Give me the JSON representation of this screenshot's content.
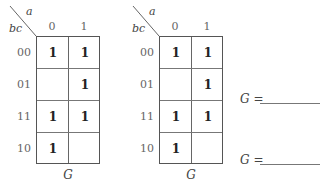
{
  "kmaps": [
    {
      "var_top": "a",
      "var_left": "bc",
      "col_headers": [
        "0",
        "1"
      ],
      "row_headers": [
        "00",
        "01",
        "11",
        "10"
      ],
      "cells": [
        [
          "1",
          "1"
        ],
        [
          "",
          "1"
        ],
        [
          "1",
          "1"
        ],
        [
          "1",
          ""
        ]
      ],
      "name": "G"
    },
    {
      "var_top": "a",
      "var_left": "bc",
      "col_headers": [
        "0",
        "1"
      ],
      "row_headers": [
        "00",
        "01",
        "11",
        "10"
      ],
      "cells": [
        [
          "1",
          "1"
        ],
        [
          "",
          "1"
        ],
        [
          "1",
          "1"
        ],
        [
          "1",
          ""
        ]
      ],
      "name": "G"
    }
  ],
  "answers": [
    {
      "var": "G",
      "op": " ="
    },
    {
      "var": "G",
      "op": " ="
    }
  ]
}
